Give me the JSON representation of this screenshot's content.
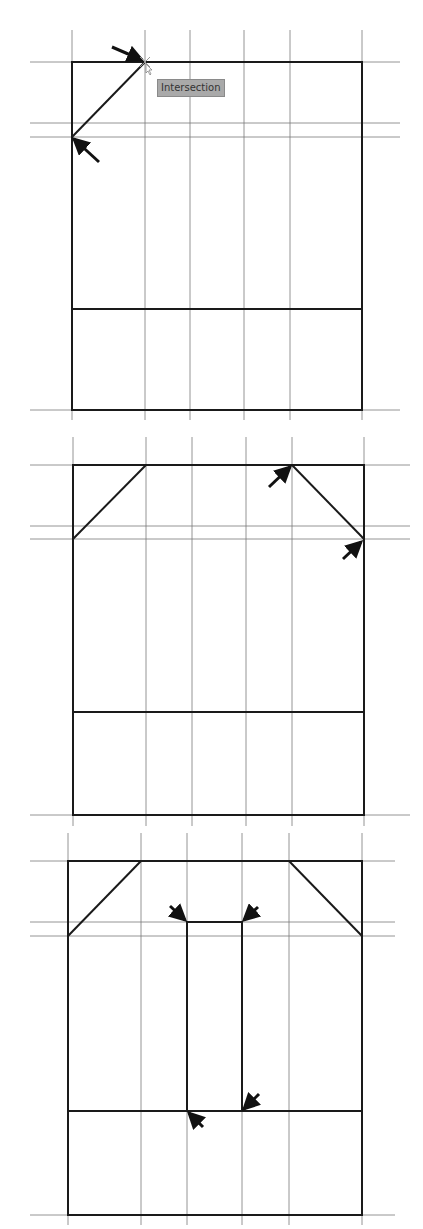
{
  "figure": {
    "colors": {
      "grid": "#7a7a7a",
      "outline": "#1a1a1a",
      "arrow": "#111111",
      "tooltip_bg": "#a9a9a9"
    }
  },
  "tooltip": {
    "label": "Intersection"
  },
  "panels": [
    {
      "name": "step-1",
      "verticals": [
        72,
        145,
        190,
        244,
        290,
        362
      ],
      "vtop": 30,
      "vbottom": 420,
      "horizontals": [
        62,
        123,
        137,
        410
      ],
      "hleft": 30,
      "hright": 400,
      "outline": {
        "x1": 72,
        "y1": 62,
        "x2": 362,
        "y2": 410
      },
      "midline": 309,
      "chamfers": [
        [
          145,
          62,
          72,
          137
        ]
      ],
      "inner_rect": null,
      "arrows": [
        {
          "x": 142,
          "y": 60,
          "from_x": 112,
          "from_y": 47
        },
        {
          "x": 74,
          "y": 139,
          "from_x": 99,
          "from_y": 162
        }
      ]
    },
    {
      "name": "step-2",
      "verticals": [
        73,
        146,
        192,
        246,
        292,
        364
      ],
      "vtop": 437,
      "vbottom": 826,
      "horizontals": [
        465,
        526,
        539,
        815
      ],
      "hleft": 30,
      "hright": 410,
      "outline": {
        "x1": 73,
        "y1": 465,
        "x2": 364,
        "y2": 815
      },
      "midline": 712,
      "chamfers": [
        [
          146,
          465,
          73,
          539
        ],
        [
          292,
          465,
          364,
          539
        ]
      ],
      "inner_rect": null,
      "arrows": [
        {
          "x": 290,
          "y": 467,
          "from_x": 269,
          "from_y": 487
        },
        {
          "x": 361,
          "y": 542,
          "from_x": 343,
          "from_y": 559
        }
      ]
    },
    {
      "name": "step-3",
      "verticals": [
        68,
        141,
        187,
        242,
        289,
        362
      ],
      "vtop": 833,
      "vbottom": 1225,
      "horizontals": [
        861,
        922,
        936,
        1215
      ],
      "hleft": 30,
      "hright": 395,
      "outline": {
        "x1": 68,
        "y1": 861,
        "x2": 362,
        "y2": 1215
      },
      "midline": 1111,
      "chamfers": [
        [
          141,
          861,
          68,
          936
        ],
        [
          289,
          861,
          362,
          936
        ]
      ],
      "inner_rect": {
        "x1": 187,
        "y1": 922,
        "x2": 242,
        "y2": 1111
      },
      "arrows": [
        {
          "x": 185,
          "y": 920,
          "from_x": 170,
          "from_y": 906
        },
        {
          "x": 244,
          "y": 920,
          "from_x": 258,
          "from_y": 907
        },
        {
          "x": 244,
          "y": 1109,
          "from_x": 259,
          "from_y": 1094
        },
        {
          "x": 189,
          "y": 1113,
          "from_x": 203,
          "from_y": 1127
        }
      ]
    }
  ]
}
